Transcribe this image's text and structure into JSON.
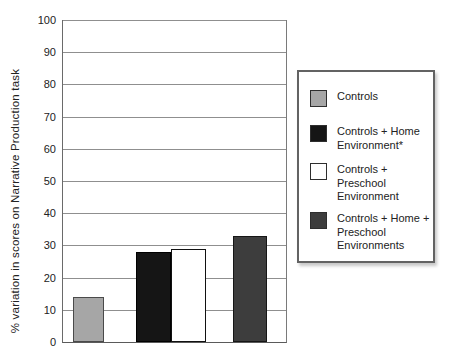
{
  "chart_data": {
    "type": "bar",
    "title": "",
    "xlabel": "",
    "ylabel": "% variation in scores on Narrative Production task",
    "ylim": [
      0,
      100
    ],
    "yticks": [
      0,
      10,
      20,
      30,
      40,
      50,
      60,
      70,
      80,
      90,
      100
    ],
    "grid": "horizontal",
    "legend_position": "right",
    "categories": [
      "Controls",
      "Controls + Home Environment*",
      "Controls + Preschool Environment",
      "Controls + Home + Preschool Environments"
    ],
    "values": [
      14,
      28,
      29,
      33
    ],
    "bar_colors": [
      "#a6a6a6",
      "#151515",
      "#ffffff",
      "#3d3d3d"
    ],
    "bar_border_colors": [
      "#4a4a4a",
      "#000000",
      "#111111",
      "#161616"
    ],
    "legend": {
      "items": [
        {
          "label": "Controls",
          "lines": [
            "Controls"
          ],
          "color": "#a6a6a6"
        },
        {
          "label": "Controls + Home Environment*",
          "lines": [
            "Controls + Home",
            "Environment*"
          ],
          "color": "#151515"
        },
        {
          "label": "Controls + Preschool Environment",
          "lines": [
            "Controls +",
            "Preschool",
            "Environment"
          ],
          "color": "#ffffff"
        },
        {
          "label": "Controls + Home + Preschool Environments",
          "lines": [
            "Controls + Home +",
            "Preschool",
            "Environments"
          ],
          "color": "#3d3d3d"
        }
      ]
    }
  },
  "colors": {
    "background": "#ffffff",
    "gridline": "#8f8f8f",
    "axis": "#5a5a5a",
    "text": "#1c1c1c",
    "legend_border": "#636363"
  }
}
